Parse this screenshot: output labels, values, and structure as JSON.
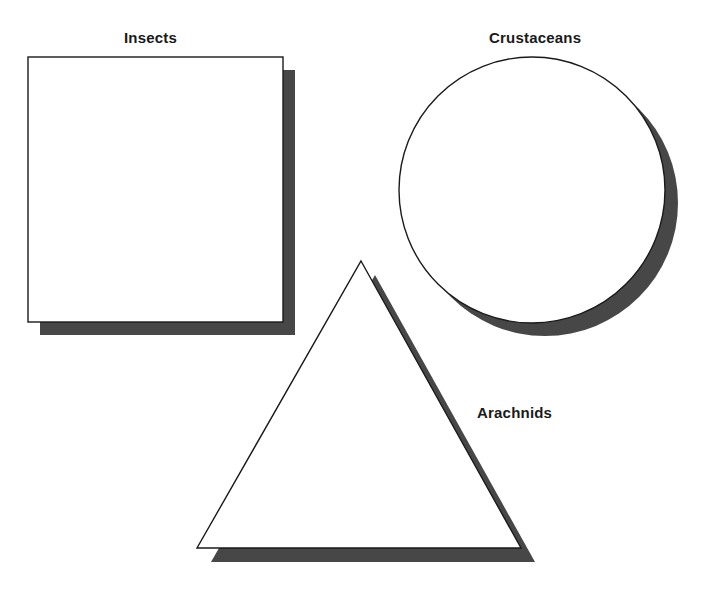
{
  "figure": {
    "background_color": "#ffffff",
    "outline_color": "#1a1a1a",
    "shadow_color": "#474747",
    "fill_color": "#ffffff",
    "shapes": [
      {
        "id": "square",
        "icon_name": "square-shape",
        "label": "Insects",
        "label_position": "above",
        "body": {
          "x": 28,
          "y": 57,
          "width": 255,
          "height": 265
        },
        "shadow_offset": {
          "dx": 12,
          "dy": 13
        }
      },
      {
        "id": "circle",
        "icon_name": "circle-shape",
        "label": "Crustaceans",
        "label_position": "above",
        "body": {
          "cx": 532,
          "cy": 190,
          "r": 133
        },
        "shadow_offset": {
          "dx": 13,
          "dy": 13
        }
      },
      {
        "id": "triangle",
        "icon_name": "triangle-shape",
        "label": "Arachnids",
        "label_position": "right",
        "body": {
          "apex_x": 361,
          "apex_y": 261,
          "left_x": 197,
          "right_x": 521,
          "base_y": 548
        },
        "shadow_offset": {
          "dx": 14,
          "dy": 14
        }
      }
    ]
  },
  "labels": {
    "insects": "Insects",
    "crustaceans": "Crustaceans",
    "arachnids": "Arachnids"
  }
}
